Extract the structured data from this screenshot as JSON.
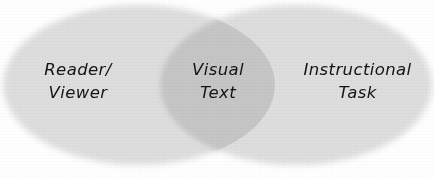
{
  "diagram": {
    "type": "venn-2set",
    "title": "",
    "background_color": "#ffffff",
    "set_fill_color": "#dedede",
    "overlap_fill_color": "#c6c6c6",
    "text_color": "#141414",
    "sets": [
      {
        "id": "reader-viewer",
        "role": "left-set",
        "label_lines": [
          "Reader/",
          "Viewer"
        ],
        "line1": "Reader/",
        "line2": "Viewer",
        "fill": "#dedede"
      },
      {
        "id": "instructional-task",
        "role": "right-set",
        "label_lines": [
          "Instructional",
          "Task"
        ],
        "line1": "Instructional",
        "line2": "Task",
        "fill": "#dedede"
      }
    ],
    "intersection": {
      "id": "visual-text",
      "role": "overlap",
      "label_lines": [
        "Visual",
        "Text"
      ],
      "line1": "Visual",
      "line2": "Text",
      "fill": "#c6c6c6"
    }
  }
}
